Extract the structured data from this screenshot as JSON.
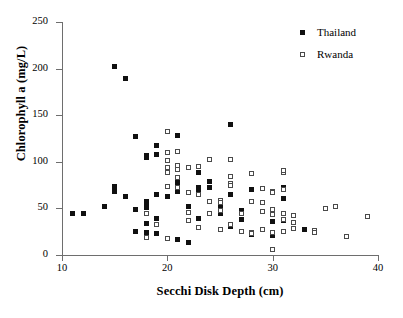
{
  "chart_data": {
    "type": "scatter",
    "title": "",
    "xlabel": "Secchi Disk Depth (cm)",
    "ylabel": "Chlorophyll a (mg/L)",
    "xlim": [
      10,
      40
    ],
    "ylim": [
      0,
      250
    ],
    "xticks": [
      10,
      20,
      30,
      40
    ],
    "yticks": [
      0,
      50,
      100,
      150,
      200,
      250
    ],
    "grid": false,
    "legend_position": "top-right",
    "series": [
      {
        "name": "Thailand",
        "marker": "filled-square",
        "color": "#101010",
        "points": [
          [
            11,
            45
          ],
          [
            12,
            45
          ],
          [
            14,
            52
          ],
          [
            15,
            202
          ],
          [
            15,
            73
          ],
          [
            15,
            68
          ],
          [
            16,
            189
          ],
          [
            16,
            63
          ],
          [
            17,
            127
          ],
          [
            17,
            49
          ],
          [
            17,
            25
          ],
          [
            18,
            107
          ],
          [
            18,
            105
          ],
          [
            18,
            57
          ],
          [
            18,
            54
          ],
          [
            18,
            51
          ],
          [
            18,
            34
          ],
          [
            18,
            24
          ],
          [
            18,
            21
          ],
          [
            19,
            117
          ],
          [
            19,
            108
          ],
          [
            19,
            65
          ],
          [
            19,
            39
          ],
          [
            19,
            23
          ],
          [
            20,
            73
          ],
          [
            20,
            63
          ],
          [
            20,
            18
          ],
          [
            21,
            128
          ],
          [
            21,
            95
          ],
          [
            21,
            80
          ],
          [
            21,
            75
          ],
          [
            21,
            72
          ],
          [
            21,
            68
          ],
          [
            21,
            17
          ],
          [
            22,
            52
          ],
          [
            22,
            13
          ],
          [
            23,
            88
          ],
          [
            23,
            72
          ],
          [
            23,
            70
          ],
          [
            23,
            39
          ],
          [
            24,
            79
          ],
          [
            24,
            72
          ],
          [
            25,
            52
          ],
          [
            25,
            48
          ],
          [
            25,
            45
          ],
          [
            25,
            44
          ],
          [
            26,
            140
          ],
          [
            26,
            65
          ],
          [
            26,
            33
          ],
          [
            26,
            31
          ],
          [
            27,
            48
          ],
          [
            27,
            38
          ],
          [
            28,
            70
          ],
          [
            28,
            22
          ],
          [
            30,
            44
          ],
          [
            30,
            36
          ],
          [
            30,
            21
          ],
          [
            31,
            72
          ],
          [
            31,
            61
          ],
          [
            31,
            37
          ],
          [
            33,
            27
          ]
        ]
      },
      {
        "name": "Rwanda",
        "marker": "open-square",
        "color": "#ffffff",
        "points": [
          [
            18,
            44
          ],
          [
            18,
            19
          ],
          [
            19,
            33
          ],
          [
            20,
            133
          ],
          [
            20,
            110
          ],
          [
            20,
            101
          ],
          [
            20,
            94
          ],
          [
            20,
            88
          ],
          [
            20,
            73
          ],
          [
            20,
            18
          ],
          [
            21,
            111
          ],
          [
            21,
            96
          ],
          [
            21,
            92
          ],
          [
            21,
            83
          ],
          [
            21,
            72
          ],
          [
            22,
            94
          ],
          [
            22,
            67
          ],
          [
            22,
            46
          ],
          [
            22,
            37
          ],
          [
            23,
            95
          ],
          [
            23,
            65
          ],
          [
            23,
            29
          ],
          [
            24,
            102
          ],
          [
            24,
            57
          ],
          [
            24,
            44
          ],
          [
            25,
            59
          ],
          [
            25,
            56
          ],
          [
            25,
            48
          ],
          [
            25,
            27
          ],
          [
            26,
            102
          ],
          [
            26,
            84
          ],
          [
            26,
            77
          ],
          [
            26,
            75
          ],
          [
            26,
            33
          ],
          [
            27,
            44
          ],
          [
            27,
            25
          ],
          [
            28,
            87
          ],
          [
            28,
            57
          ],
          [
            28,
            24
          ],
          [
            28,
            23
          ],
          [
            29,
            71
          ],
          [
            29,
            56
          ],
          [
            29,
            47
          ],
          [
            29,
            27
          ],
          [
            30,
            68
          ],
          [
            30,
            67
          ],
          [
            30,
            49
          ],
          [
            30,
            43
          ],
          [
            30,
            24
          ],
          [
            30,
            6
          ],
          [
            31,
            89
          ],
          [
            31,
            91
          ],
          [
            31,
            70
          ],
          [
            31,
            45
          ],
          [
            31,
            38
          ],
          [
            31,
            25
          ],
          [
            32,
            42
          ],
          [
            32,
            35
          ],
          [
            32,
            28
          ],
          [
            34,
            26
          ],
          [
            34,
            24
          ],
          [
            35,
            50
          ],
          [
            36,
            52
          ],
          [
            37,
            20
          ],
          [
            39,
            41
          ]
        ]
      }
    ]
  },
  "axes": {
    "y_title": "Chlorophyll a (mg/L)",
    "x_title": "Secchi Disk Depth (cm)",
    "y_tick_labels": [
      "0",
      "50",
      "100",
      "150",
      "200",
      "250"
    ],
    "x_tick_labels": [
      "10",
      "20",
      "30",
      "40"
    ]
  },
  "legend": {
    "items": [
      {
        "label": "Thailand",
        "marker": "filled-square"
      },
      {
        "label": "Rwanda",
        "marker": "open-square"
      }
    ]
  },
  "caption": {
    "text": ""
  }
}
